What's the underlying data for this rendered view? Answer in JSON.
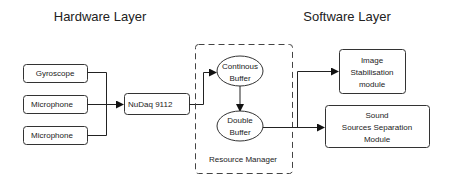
{
  "titles": {
    "hardware": "Hardware Layer",
    "software": "Software Layer"
  },
  "hardware": {
    "sensors": [
      {
        "label": "Gyroscope"
      },
      {
        "label": "Microphone"
      },
      {
        "label": "Microphone"
      }
    ],
    "daq": {
      "label": "NuDaq 9112"
    }
  },
  "resource_manager": {
    "label": "Resource Manager",
    "continuous_buffer": {
      "line1": "Continous",
      "line2": "Buffer"
    },
    "double_buffer": {
      "line1": "Double",
      "line2": "Buffer"
    }
  },
  "modules": {
    "image": {
      "line1": "Image",
      "line2": "Stabilisation",
      "line3": "module"
    },
    "sound": {
      "line1": "Sound",
      "line2": "Sources Separation",
      "line3": "Module"
    }
  },
  "colors": {
    "stroke": "#333333",
    "text": "#222222",
    "background": "#ffffff"
  }
}
